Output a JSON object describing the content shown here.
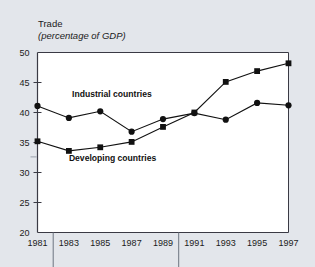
{
  "chart_data": {
    "type": "line",
    "title": "Trade",
    "subtitle": "(percentage of GDP)",
    "xlabel": "",
    "ylabel": "",
    "x": [
      1981,
      1983,
      1985,
      1987,
      1989,
      1991,
      1993,
      1995,
      1997
    ],
    "xtick_labels": [
      "1981",
      "1983",
      "1985",
      "1987",
      "1989",
      "1991",
      "1993",
      "1995",
      "1997"
    ],
    "ytick_labels": [
      "20",
      "25",
      "30",
      "35",
      "40",
      "45",
      "50"
    ],
    "yticks": [
      20,
      25,
      30,
      35,
      40,
      45,
      50
    ],
    "ylim": [
      20,
      50
    ],
    "xlim": [
      1981,
      1997
    ],
    "grid": false,
    "legend_position": "inline-annotations",
    "series": [
      {
        "name": "Industrial countries",
        "marker": "circle",
        "color": "#111111",
        "values": [
          41.1,
          39.1,
          40.2,
          36.8,
          38.9,
          39.9,
          38.8,
          41.6,
          41.2
        ]
      },
      {
        "name": "Developing countries",
        "marker": "square",
        "color": "#111111",
        "values": [
          35.2,
          33.6,
          34.2,
          35.1,
          37.6,
          40.0,
          45.1,
          46.9,
          48.2
        ]
      }
    ],
    "annotations": [
      {
        "text": "Industrial countries",
        "x": 1983.2,
        "y": 42.6
      },
      {
        "text": "Developing countries",
        "x": 1983.0,
        "y": 31.9
      }
    ]
  },
  "colors": {
    "page_background": "#e3e6eb",
    "plot_background": "#ffffff",
    "axis": "#3a3a44",
    "ink": "#111111"
  }
}
